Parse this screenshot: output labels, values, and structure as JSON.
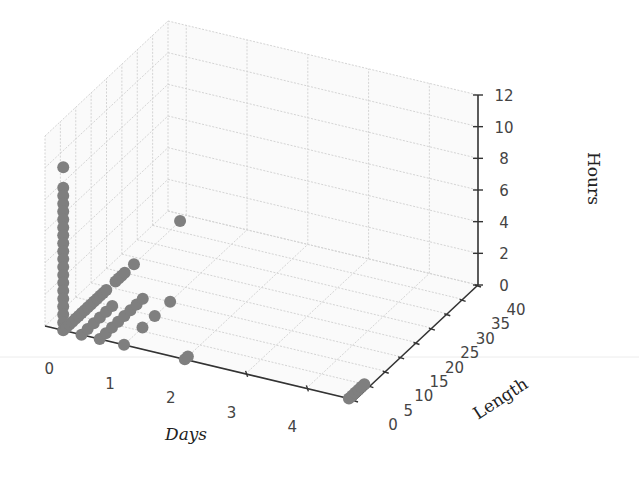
{
  "chart_data": {
    "type": "scatter3d",
    "title": "",
    "xlabel": "Days",
    "ylabel": "Length",
    "zlabel": "Hours",
    "xlim": [
      -0.3,
      4.8
    ],
    "ylim": [
      0,
      40
    ],
    "zlim": [
      0,
      12
    ],
    "xticks": [
      "0",
      "1",
      "2",
      "3",
      "4"
    ],
    "yticks": [
      "0",
      "5",
      "10",
      "15",
      "20",
      "25",
      "30",
      "35",
      "40"
    ],
    "zticks": [
      "0",
      "2",
      "4",
      "6",
      "8",
      "10",
      "12"
    ],
    "grid": true,
    "marker_color": "#7f7f7f",
    "points": [
      {
        "x": 0.0,
        "y": 0.0,
        "z": 10.3
      },
      {
        "x": 0.0,
        "y": 0.0,
        "z": 9.0
      },
      {
        "x": 0.0,
        "y": 0.0,
        "z": 8.5
      },
      {
        "x": 0.0,
        "y": 0.0,
        "z": 8.0
      },
      {
        "x": 0.0,
        "y": 0.0,
        "z": 7.5
      },
      {
        "x": 0.0,
        "y": 0.0,
        "z": 7.0
      },
      {
        "x": 0.0,
        "y": 0.0,
        "z": 6.5
      },
      {
        "x": 0.0,
        "y": 0.0,
        "z": 6.0
      },
      {
        "x": 0.0,
        "y": 0.0,
        "z": 5.5
      },
      {
        "x": 0.0,
        "y": 0.0,
        "z": 5.0
      },
      {
        "x": 0.0,
        "y": 0.0,
        "z": 4.5
      },
      {
        "x": 0.0,
        "y": 0.0,
        "z": 4.0
      },
      {
        "x": 0.0,
        "y": 0.0,
        "z": 3.5
      },
      {
        "x": 0.0,
        "y": 0.0,
        "z": 3.0
      },
      {
        "x": 0.0,
        "y": 0.0,
        "z": 2.5
      },
      {
        "x": 0.0,
        "y": 0.0,
        "z": 2.0
      },
      {
        "x": 0.0,
        "y": 0.0,
        "z": 1.5
      },
      {
        "x": 0.0,
        "y": 0.0,
        "z": 1.0
      },
      {
        "x": 0.0,
        "y": 0.0,
        "z": 0.5
      },
      {
        "x": 0.0,
        "y": 0.0,
        "z": 0.0
      },
      {
        "x": 0.0,
        "y": 1.0,
        "z": 0.0
      },
      {
        "x": 0.0,
        "y": 2.0,
        "z": 0.0
      },
      {
        "x": 0.0,
        "y": 3.0,
        "z": 0.0
      },
      {
        "x": 0.0,
        "y": 4.0,
        "z": 0.0
      },
      {
        "x": 0.0,
        "y": 5.0,
        "z": 0.0
      },
      {
        "x": 0.0,
        "y": 6.0,
        "z": 0.0
      },
      {
        "x": 0.0,
        "y": 7.0,
        "z": 0.0
      },
      {
        "x": 0.0,
        "y": 8.0,
        "z": 0.0
      },
      {
        "x": 0.0,
        "y": 9.0,
        "z": 0.0
      },
      {
        "x": 0.0,
        "y": 10.0,
        "z": 0.0
      },
      {
        "x": 0.0,
        "y": 11.0,
        "z": 0.0
      },
      {
        "x": 0.0,
        "y": 12.0,
        "z": 0.0
      },
      {
        "x": 0.0,
        "y": 13.0,
        "z": 0.0
      },
      {
        "x": 0.0,
        "y": 14.0,
        "z": 0.0
      },
      {
        "x": 0.0,
        "y": 17.0,
        "z": 0.0
      },
      {
        "x": 0.0,
        "y": 18.0,
        "z": 0.0
      },
      {
        "x": 0.0,
        "y": 19.0,
        "z": 0.0
      },
      {
        "x": 0.0,
        "y": 20.0,
        "z": 0.0
      },
      {
        "x": 0.0,
        "y": 23.0,
        "z": 0.0
      },
      {
        "x": 0.3,
        "y": 0.0,
        "z": 0.0
      },
      {
        "x": 0.3,
        "y": 2.0,
        "z": 0.0
      },
      {
        "x": 0.3,
        "y": 4.0,
        "z": 0.0
      },
      {
        "x": 0.3,
        "y": 6.0,
        "z": 0.0
      },
      {
        "x": 0.3,
        "y": 8.0,
        "z": 0.0
      },
      {
        "x": 0.3,
        "y": 10.0,
        "z": 0.0
      },
      {
        "x": 0.6,
        "y": 0.0,
        "z": 0.0
      },
      {
        "x": 0.6,
        "y": 2.0,
        "z": 0.0
      },
      {
        "x": 0.6,
        "y": 4.0,
        "z": 0.0
      },
      {
        "x": 0.6,
        "y": 6.0,
        "z": 0.0
      },
      {
        "x": 0.6,
        "y": 8.0,
        "z": 0.0
      },
      {
        "x": 0.6,
        "y": 10.0,
        "z": 0.0
      },
      {
        "x": 0.6,
        "y": 12.0,
        "z": 0.0
      },
      {
        "x": 0.6,
        "y": 14.0,
        "z": 0.0
      },
      {
        "x": 1.0,
        "y": 0.0,
        "z": 0.0
      },
      {
        "x": 1.0,
        "y": 6.0,
        "z": 0.0
      },
      {
        "x": 1.0,
        "y": 10.0,
        "z": 0.0
      },
      {
        "x": 1.0,
        "y": 15.0,
        "z": 0.0
      },
      {
        "x": 2.0,
        "y": 0.0,
        "z": 0.0
      },
      {
        "x": 2.0,
        "y": 1.0,
        "z": 0.0
      },
      {
        "x": 4.7,
        "y": 0.0,
        "z": 0.0
      },
      {
        "x": 4.7,
        "y": 1.0,
        "z": 0.0
      },
      {
        "x": 4.7,
        "y": 2.0,
        "z": 0.0
      },
      {
        "x": 4.7,
        "y": 3.0,
        "z": 0.0
      },
      {
        "x": 4.7,
        "y": 4.0,
        "z": 0.0
      },
      {
        "x": 4.7,
        "y": 5.0,
        "z": 0.0
      },
      {
        "x": 0.0,
        "y": 38.0,
        "z": 0.0
      }
    ]
  }
}
